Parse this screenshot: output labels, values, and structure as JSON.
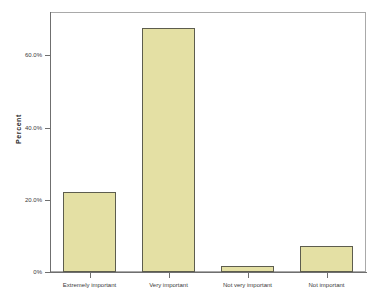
{
  "chart_data": {
    "type": "bar",
    "title": "",
    "xlabel": "",
    "ylabel": "Percent",
    "categories": [
      "Extremely important",
      "Very important",
      "Not very important",
      "Not important"
    ],
    "values": [
      22.2,
      67.6,
      1.7,
      7.1
    ],
    "ylim": [
      0,
      72
    ],
    "yticks": [
      0,
      20,
      40,
      60
    ],
    "ytick_labels": [
      "0%",
      "20.0%",
      "40.0%",
      "60.0%"
    ],
    "grid": false,
    "legend": null,
    "series": [
      {
        "name": "Percent",
        "values": [
          22.2,
          67.6,
          1.7,
          7.1
        ]
      }
    ],
    "bar_fill_color": "#e4e0a4",
    "bar_border_color": "#5d5d4e",
    "axis_color": "#6f6f6f",
    "frame_color": "#a9a9a9",
    "background_color": "#ffffff"
  }
}
